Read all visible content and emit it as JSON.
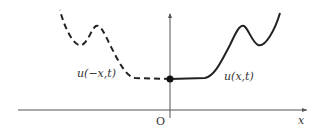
{
  "diagram": {
    "labels": {
      "left_curve": "u(−x,t)",
      "right_curve": "u(x,t)",
      "origin": "O",
      "x_axis": "x"
    },
    "colors": {
      "curve": "#222222",
      "axis": "#555555",
      "text": "#333333"
    }
  }
}
